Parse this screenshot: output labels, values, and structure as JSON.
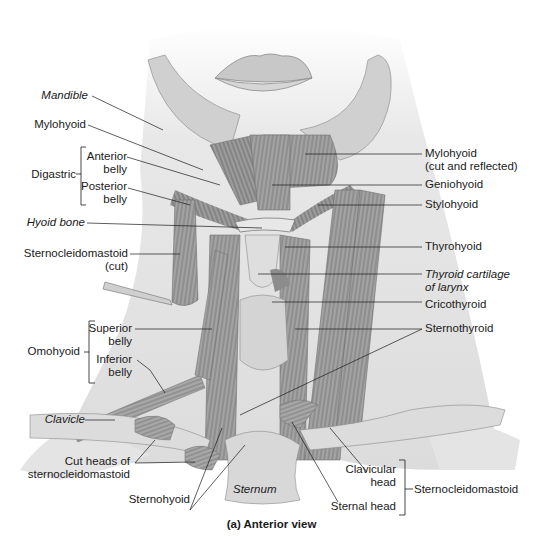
{
  "figure": {
    "caption": "(a) Anterior view",
    "view": "Anterior view of neck muscles"
  },
  "left_labels": {
    "mandible": "Mandible",
    "mylohyoid": "Mylohyoid",
    "digastric": "Digastric",
    "digastric_anterior_1": "Anterior",
    "digastric_anterior_2": "belly",
    "digastric_posterior_1": "Posterior",
    "digastric_posterior_2": "belly",
    "hyoid_bone": "Hyoid bone",
    "scm_cut_1": "Sternocleidomastoid",
    "scm_cut_2": "(cut)",
    "omohyoid": "Omohyoid",
    "omohyoid_superior_1": "Superior",
    "omohyoid_superior_2": "belly",
    "omohyoid_inferior_1": "Inferior",
    "omohyoid_inferior_2": "belly",
    "clavicle": "Clavicle",
    "cut_heads_1": "Cut heads of",
    "cut_heads_2": "sternocleidomastoid",
    "sternohyoid": "Sternohyoid",
    "sternum": "Sternum"
  },
  "right_labels": {
    "mylohyoid_cut_1": "Mylohyoid",
    "mylohyoid_cut_2": "(cut and reflected)",
    "geniohyoid": "Geniohyoid",
    "stylohyoid": "Stylohyoid",
    "thyrohyoid": "Thyrohyoid",
    "thyroid_cartilage_1": "Thyroid cartilage",
    "thyroid_cartilage_2": "of larynx",
    "cricothyroid": "Cricothyroid",
    "sternothyroid": "Sternothyroid",
    "clavicular_head_1": "Clavicular",
    "clavicular_head_2": "head",
    "sternal_head": "Sternal head",
    "sternocleidomastoid": "Sternocleidomastoid"
  },
  "colors": {
    "skin": "#e6e6e6",
    "muscle": "#9a9a9a",
    "muscle_dark": "#6e6e6e",
    "bone": "#d2d2d2",
    "leader": "#1a1a1a"
  }
}
